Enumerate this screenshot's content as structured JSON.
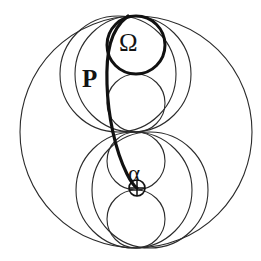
{
  "figure": {
    "background_color": "#ffffff",
    "stroke_color": "#2b2b2b",
    "thick_stroke_color": "#111111",
    "canvas": {
      "width": 261,
      "height": 261
    }
  },
  "labels": {
    "omega": "Ω",
    "p": "P",
    "alpha": "α"
  },
  "geometry": {
    "outer_circle": {
      "name": "outer-circle",
      "cx": 136,
      "cy": 132,
      "r": 116,
      "stroke_width": 1.1
    },
    "medium_circles": [
      {
        "name": "upper-medium-circle",
        "cx": 133,
        "cy": 74,
        "r": 58,
        "stroke_width": 1.1
      },
      {
        "name": "lower-medium-circle",
        "cx": 134,
        "cy": 190,
        "r": 58,
        "stroke_width": 1.1
      },
      {
        "name": "upper-left-medium-circle",
        "cx": 118,
        "cy": 74,
        "r": 58,
        "stroke_width": 1.1
      },
      {
        "name": "lower-right-medium-circle",
        "cx": 150,
        "cy": 190,
        "r": 58,
        "stroke_width": 1.1
      }
    ],
    "chain_circles": [
      {
        "name": "chain-circle-omega",
        "cx": 136,
        "cy": 45,
        "r": 29,
        "stroke_width": 3.0,
        "label": "Ω"
      },
      {
        "name": "chain-circle-2",
        "cx": 136,
        "cy": 103,
        "r": 29,
        "stroke_width": 1.1
      },
      {
        "name": "chain-circle-3",
        "cx": 136,
        "cy": 161,
        "r": 29,
        "stroke_width": 1.1
      },
      {
        "name": "chain-circle-4",
        "cx": 136,
        "cy": 219,
        "r": 29,
        "stroke_width": 1.1
      }
    ],
    "alpha_circle": {
      "name": "alpha-point-circle",
      "cx": 137,
      "cy": 188,
      "r": 8,
      "stroke_width": 1.6
    },
    "alpha_cross": {
      "name": "alpha-cross-marker",
      "cx": 137,
      "cy": 188,
      "r": 8
    },
    "thick_curve": {
      "name": "pappus-locus-curve",
      "stroke_width": 3.2,
      "path": "M 128 16 C 110 30 106 52 107 84 C 108 116 115 150 127 174 C 131 182 134 186 137 188"
    }
  }
}
